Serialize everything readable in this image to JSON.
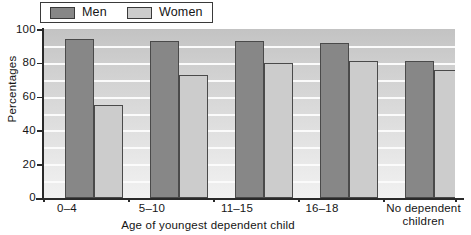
{
  "chart_data": {
    "type": "bar",
    "title": "",
    "subtitle": "",
    "xlabel": "Age of youngest dependent child",
    "ylabel": "Percentages",
    "categories": [
      "0–4",
      "5–10",
      "11–15",
      "16–18",
      "No dependent children"
    ],
    "series": [
      {
        "name": "Men",
        "color": "#878787",
        "values": [
          94,
          93,
          93,
          92,
          81
        ]
      },
      {
        "name": "Women",
        "color": "#cccccc",
        "values": [
          55,
          73,
          80,
          81,
          76
        ]
      }
    ],
    "ylim": [
      0,
      100
    ],
    "ytick_labels": [
      "0",
      "20",
      "40",
      "60",
      "80",
      "100"
    ],
    "ytick_values": [
      0,
      20,
      40,
      60,
      80,
      100
    ],
    "gridlines": true,
    "gridline_interval": 10,
    "legend_position": "top-left",
    "grouped": true
  },
  "legend": {
    "entries": [
      {
        "label": "Men",
        "swatch": "men"
      },
      {
        "label": "Women",
        "swatch": "women"
      }
    ]
  },
  "axes": {
    "y_title": "Percentages",
    "x_title": "Age of youngest dependent child",
    "y_ticks": [
      "100",
      "80",
      "60",
      "40",
      "20",
      "0"
    ],
    "x_categories": [
      {
        "line1": "0–4",
        "line2": ""
      },
      {
        "line1": "5–10",
        "line2": ""
      },
      {
        "line1": "11–15",
        "line2": ""
      },
      {
        "line1": "16–18",
        "line2": ""
      },
      {
        "line1": "No dependent",
        "line2": "children"
      }
    ]
  },
  "colors": {
    "men": "#878787",
    "women": "#cccccc",
    "axis": "#2a2a2a",
    "gridline": "#fbfbfb",
    "text": "#151515"
  }
}
